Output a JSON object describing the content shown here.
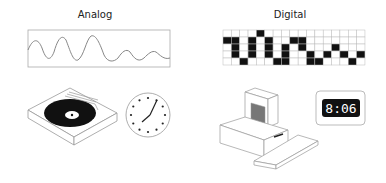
{
  "analog": {
    "title": "Analog",
    "items": [
      "waveform",
      "record-player",
      "analog-clock"
    ]
  },
  "digital": {
    "title": "Digital",
    "items": [
      "binary-grid",
      "desktop-computer",
      "digital-clock"
    ],
    "clock_display": "8:06",
    "grid": {
      "cols": 17,
      "rows": 5,
      "filled": [
        [
          0,
          4
        ],
        [
          1,
          0
        ],
        [
          1,
          1
        ],
        [
          1,
          3
        ],
        [
          1,
          5
        ],
        [
          1,
          8
        ],
        [
          1,
          9
        ],
        [
          2,
          1
        ],
        [
          2,
          3
        ],
        [
          2,
          5
        ],
        [
          2,
          7
        ],
        [
          2,
          9
        ],
        [
          2,
          13
        ],
        [
          3,
          1
        ],
        [
          3,
          3
        ],
        [
          3,
          5
        ],
        [
          3,
          7
        ],
        [
          3,
          10
        ],
        [
          3,
          12
        ],
        [
          3,
          14
        ],
        [
          3,
          16
        ],
        [
          4,
          2
        ],
        [
          4,
          6
        ],
        [
          4,
          7
        ],
        [
          4,
          10
        ],
        [
          4,
          11
        ],
        [
          4,
          15
        ]
      ]
    }
  },
  "colors": {
    "line": "#888888",
    "fill": "#111111",
    "screen": "#777777",
    "background": "#ffffff"
  }
}
